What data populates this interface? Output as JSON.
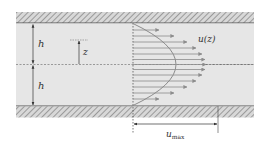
{
  "diagram": {
    "labels": {
      "h_upper": "h",
      "h_lower": "h",
      "z": "z",
      "velocity_profile": "u(z)",
      "u_max_base": "u",
      "u_max_sub": "max"
    },
    "colors": {
      "fluid": "#e6e6e6",
      "wall_hatch": "#9a9a9a",
      "wall_line": "#555555",
      "arrow": "#8c8c8c",
      "centerline": "#777777"
    },
    "profile": {
      "shape": "parabolic",
      "arrow_count": 13
    }
  }
}
